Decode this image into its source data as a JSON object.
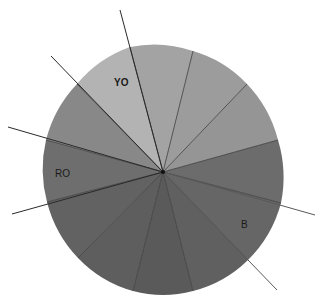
{
  "diagram": {
    "type": "color-wheel",
    "center": [
      163,
      172
    ],
    "radius": [
      121,
      125
    ],
    "segments": [
      {
        "id": "s1",
        "rim_start": [
          130,
          47
        ],
        "rim_end": [
          193,
          51
        ],
        "fill": "#a3a3a3",
        "label": ""
      },
      {
        "id": "s2",
        "rim_start": [
          193,
          51
        ],
        "rim_end": [
          247,
          84
        ],
        "fill": "#9c9c9c",
        "label": ""
      },
      {
        "id": "s3",
        "rim_start": [
          247,
          84
        ],
        "rim_end": [
          278,
          140
        ],
        "fill": "#959595",
        "label": ""
      },
      {
        "id": "s4",
        "rim_start": [
          278,
          140
        ],
        "rim_end": [
          281,
          203
        ],
        "fill": "#6c6c6c",
        "label": ""
      },
      {
        "id": "s5",
        "rim_start": [
          281,
          203
        ],
        "rim_end": [
          248,
          260
        ],
        "fill": "#666666",
        "label": "B"
      },
      {
        "id": "s6",
        "rim_start": [
          248,
          260
        ],
        "rim_end": [
          193,
          291
        ],
        "fill": "#606060",
        "label": ""
      },
      {
        "id": "s7",
        "rim_start": [
          193,
          291
        ],
        "rim_end": [
          133,
          291
        ],
        "fill": "#5a5a5a",
        "label": ""
      },
      {
        "id": "s8",
        "rim_start": [
          133,
          291
        ],
        "rim_end": [
          78,
          258
        ],
        "fill": "#5e5e5e",
        "label": ""
      },
      {
        "id": "s9",
        "rim_start": [
          78,
          258
        ],
        "rim_end": [
          47,
          202
        ],
        "fill": "#626262",
        "label": ""
      },
      {
        "id": "s10",
        "rim_start": [
          47,
          202
        ],
        "rim_end": [
          46,
          140
        ],
        "fill": "#6e6e6e",
        "label": "RO"
      },
      {
        "id": "s11",
        "rim_start": [
          46,
          140
        ],
        "rim_end": [
          77,
          84
        ],
        "fill": "#888888",
        "label": ""
      },
      {
        "id": "s12",
        "rim_start": [
          77,
          84
        ],
        "rim_end": [
          130,
          47
        ],
        "fill": "#b3b3b3",
        "label": "YO"
      }
    ],
    "labels": [
      {
        "text": "YO",
        "x": 114,
        "y": 86,
        "bold": true
      },
      {
        "text": "RO",
        "x": 55,
        "y": 177,
        "bold": false
      },
      {
        "text": "B",
        "x": 241,
        "y": 228,
        "bold": false
      }
    ],
    "extended_lines": [
      {
        "from": [
          163,
          172
        ],
        "to": [
          120,
          10
        ],
        "color": "#2a2a2a"
      },
      {
        "from": [
          163,
          172
        ],
        "to": [
          51,
          56
        ],
        "color": "#2a2a2a"
      },
      {
        "from": [
          163,
          172
        ],
        "to": [
          8,
          127
        ],
        "color": "#2a2a2a"
      },
      {
        "from": [
          163,
          172
        ],
        "to": [
          12,
          214
        ],
        "color": "#2a2a2a"
      },
      {
        "from": [
          163,
          172
        ],
        "to": [
          315,
          215
        ],
        "color": "#5a5a5a"
      },
      {
        "from": [
          163,
          172
        ],
        "to": [
          277,
          290
        ],
        "color": "#5a5a5a"
      }
    ],
    "divider_color": "#3a3a3a",
    "center_dot_color": "#111111"
  }
}
